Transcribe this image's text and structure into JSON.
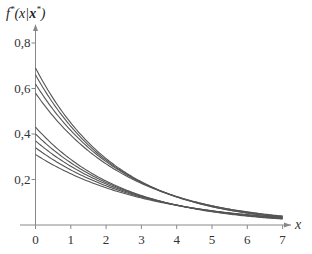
{
  "chart_data": {
    "type": "line",
    "title": "",
    "xlabel": "x",
    "ylabel": "f*(x|x*)",
    "ylabel_parts": {
      "f": "f",
      "star": "*",
      "open": "(x|",
      "bold": "x",
      "close": ")"
    },
    "xlim": [
      0,
      7
    ],
    "ylim": [
      0,
      0.8
    ],
    "x_ticks": [
      0,
      1,
      2,
      3,
      4,
      5,
      6,
      7
    ],
    "x_tick_labels": [
      "0",
      "1",
      "2",
      "3",
      "4",
      "5",
      "6",
      "7"
    ],
    "y_ticks": [
      0.2,
      0.4,
      0.6,
      0.8
    ],
    "y_tick_labels": [
      "0,2",
      "0,4",
      "0,6",
      "0,8"
    ],
    "grid": false,
    "legend": null,
    "line_color": "#555555",
    "model": "f(x) = a * exp(-b * x)",
    "series": [
      {
        "name": "upper-1",
        "a": 0.69,
        "b": 0.43,
        "values_at_ticks": [
          0.69,
          0.45,
          0.29,
          0.19,
          0.12,
          0.08,
          0.05,
          0.03
        ]
      },
      {
        "name": "upper-2",
        "a": 0.66,
        "b": 0.42,
        "values_at_ticks": [
          0.66,
          0.43,
          0.29,
          0.19,
          0.12,
          0.08,
          0.05,
          0.03
        ]
      },
      {
        "name": "upper-3",
        "a": 0.62,
        "b": 0.4,
        "values_at_ticks": [
          0.62,
          0.42,
          0.28,
          0.19,
          0.12,
          0.08,
          0.06,
          0.04
        ]
      },
      {
        "name": "upper-4",
        "a": 0.58,
        "b": 0.385,
        "values_at_ticks": [
          0.58,
          0.39,
          0.27,
          0.18,
          0.12,
          0.08,
          0.06,
          0.04
        ]
      },
      {
        "name": "lower-1",
        "a": 0.43,
        "b": 0.4,
        "values_at_ticks": [
          0.43,
          0.29,
          0.19,
          0.13,
          0.09,
          0.06,
          0.04,
          0.03
        ]
      },
      {
        "name": "lower-2",
        "a": 0.4,
        "b": 0.38,
        "values_at_ticks": [
          0.4,
          0.27,
          0.19,
          0.13,
          0.09,
          0.06,
          0.04,
          0.03
        ]
      },
      {
        "name": "lower-3",
        "a": 0.37,
        "b": 0.36,
        "values_at_ticks": [
          0.37,
          0.26,
          0.18,
          0.13,
          0.09,
          0.06,
          0.04,
          0.03
        ]
      },
      {
        "name": "lower-4",
        "a": 0.34,
        "b": 0.34,
        "values_at_ticks": [
          0.34,
          0.24,
          0.17,
          0.12,
          0.09,
          0.06,
          0.04,
          0.03
        ]
      },
      {
        "name": "lower-5",
        "a": 0.31,
        "b": 0.32,
        "values_at_ticks": [
          0.31,
          0.23,
          0.16,
          0.12,
          0.09,
          0.06,
          0.05,
          0.03
        ]
      }
    ]
  }
}
